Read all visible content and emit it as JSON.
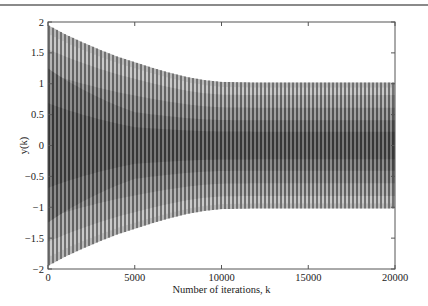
{
  "chart_data": {
    "type": "line",
    "title": "",
    "xlabel": "Number of iterations, k",
    "ylabel": "y(k)",
    "xlim": [
      0,
      20000
    ],
    "ylim": [
      -2,
      2
    ],
    "xticks": [
      0,
      5000,
      10000,
      15000,
      20000
    ],
    "xtick_labels": [
      "0",
      "5000",
      "10000",
      "15000",
      "20000"
    ],
    "yticks": [
      -2,
      -1.5,
      -1,
      -0.5,
      0,
      0.5,
      1,
      1.5,
      2
    ],
    "ytick_labels": [
      "−2",
      "−1.5",
      "−1",
      "−0.5",
      "0",
      "0.5",
      "1",
      "1.5",
      "2"
    ],
    "grid": false,
    "legend": null,
    "series": [
      {
        "name": "y(k)",
        "description": "Dense oscillation with amplitude envelope decaying from about 2 to about 1 and then remaining constant",
        "envelope": {
          "k": [
            0,
            1000,
            2000,
            3000,
            4000,
            5000,
            6000,
            7000,
            8000,
            9000,
            10000,
            12000,
            15000,
            20000
          ],
          "amplitude": [
            1.95,
            1.8,
            1.67,
            1.55,
            1.44,
            1.35,
            1.26,
            1.18,
            1.11,
            1.06,
            1.03,
            1.02,
            1.02,
            1.02
          ]
        },
        "color": "#1a1a1a"
      }
    ]
  }
}
